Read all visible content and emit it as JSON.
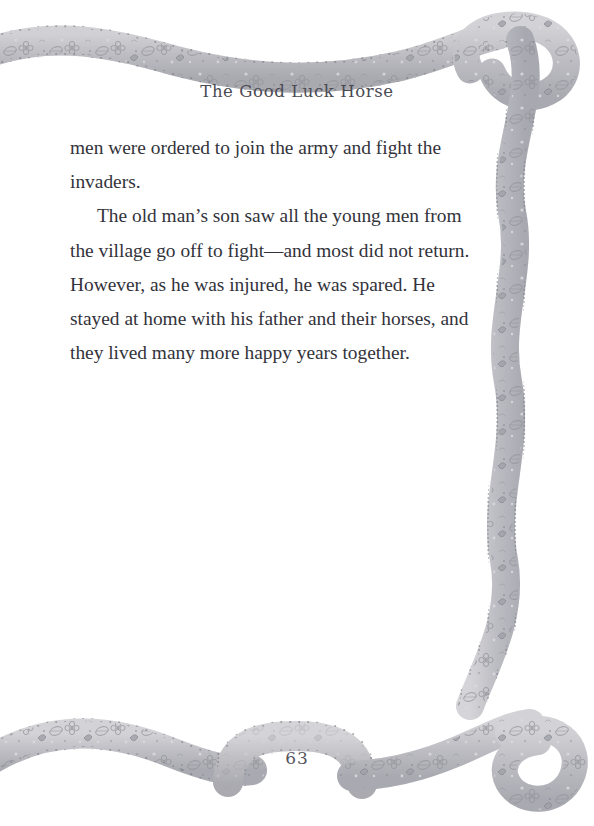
{
  "page": {
    "background_color": "#ffffff",
    "width": 594,
    "height": 826,
    "number": "63"
  },
  "header": {
    "story_title": "The Good Luck Horse"
  },
  "main": {
    "paragraphs": [
      {
        "indented": false,
        "text": "men were ordered to join the army and fight the invaders."
      },
      {
        "indented": true,
        "text": "The old man’s son saw all the young men from the village go off to fight—and most did not return. However, as he was injured, he was spared. He stayed at home with his father and their horses, and they lived many more happy years together."
      }
    ],
    "text_color": "#33333b"
  },
  "decoration": {
    "ribbon_label": "floral ribbon border",
    "ribbon_color": "#b9b9bd",
    "ribbon_fill": "#cfcfd3",
    "ribbon_motif_color": "#8e8e95",
    "ribbon_highlight": "#f2f2f4"
  }
}
